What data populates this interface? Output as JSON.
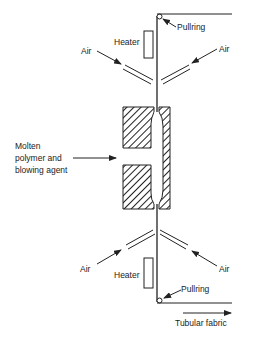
{
  "diagram": {
    "labels": {
      "pullring_top": "Pullring",
      "pullring_bottom": "Pullring",
      "heater_top": "Heater",
      "heater_bottom": "Heater",
      "air_top_left": "Air",
      "air_top_right": "Air",
      "air_bottom_left": "Air",
      "air_bottom_right": "Air",
      "feed_line1": "Molten",
      "feed_line2": "polymer and",
      "feed_line3": "blowing agent",
      "output": "Tubular fabric"
    },
    "colors": {
      "stroke": "#222222",
      "background": "#ffffff"
    }
  }
}
